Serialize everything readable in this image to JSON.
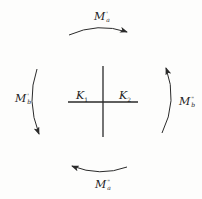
{
  "diagram": {
    "type": "moment-cross-diagram",
    "colors": {
      "line": "#2a2a2a",
      "background": "#fdfdfc",
      "text": "#222222"
    },
    "center": {
      "labels": [
        {
          "id": "K1",
          "main": "K",
          "sub": "1"
        },
        {
          "id": "K2",
          "main": "K",
          "sub": "2"
        }
      ]
    },
    "moments": {
      "top": {
        "main": "M",
        "sup": "'",
        "sub": "a",
        "direction": "clockwise"
      },
      "left": {
        "main": "M",
        "sup": "'",
        "sub": "b",
        "direction": "counterclockwise"
      },
      "right": {
        "main": "M",
        "sup": "\"",
        "sub": "b",
        "direction": "counterclockwise"
      },
      "bottom": {
        "main": "M",
        "sup": "\"",
        "sub": "a",
        "direction": "clockwise"
      }
    }
  }
}
